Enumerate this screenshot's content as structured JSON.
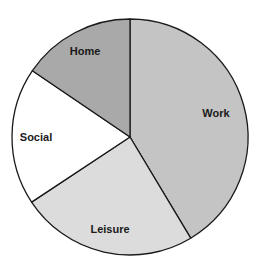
{
  "chart_data": {
    "type": "pie",
    "title": "",
    "start_angle_deg": 0,
    "direction": "clockwise",
    "categories": [
      "Work",
      "Leisure",
      "Social",
      "Home"
    ],
    "values": [
      41.4,
      24.3,
      18.8,
      15.5
    ],
    "unit": "percent (estimated from slice angles)",
    "colors": [
      "#c4c4c4",
      "#dcdcdc",
      "#ffffff",
      "#a9a9a9"
    ],
    "edge_color": "#1a1a1a",
    "legend": "none (labels drawn inside slices)",
    "labels": [
      {
        "text": "Work",
        "x": 216,
        "y": 117
      },
      {
        "text": "Leisure",
        "x": 110,
        "y": 233
      },
      {
        "text": "Social",
        "x": 36,
        "y": 141
      },
      {
        "text": "Home",
        "x": 85,
        "y": 55
      }
    ]
  },
  "geometry": {
    "cx": 130,
    "cy": 137,
    "r": 118
  }
}
